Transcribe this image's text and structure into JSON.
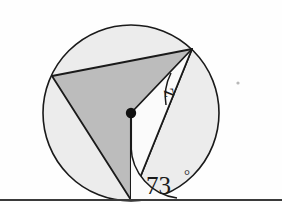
{
  "figure": {
    "background_color": "#fefefe"
  },
  "colors": {
    "stroke": "#1a1a1a",
    "circle_fill": "#ececec",
    "triangle_fill": "#bcbcbc",
    "wedge_fill": "#fbfbfb",
    "arc_fill": "#fbfbfb",
    "center_dot": "#111111",
    "baseline": "#3a3a3a",
    "speck": "#b8b8b8"
  },
  "geometry": {
    "circle": {
      "cx": 131,
      "cy": 113,
      "r": 88
    },
    "center_point": {
      "cx": 131,
      "cy": 113,
      "r": 5
    },
    "vertices": {
      "left": {
        "x": 52,
        "y": 76
      },
      "top_right": {
        "x": 192,
        "y": 49
      },
      "bottom": {
        "x": 131,
        "y": 200
      }
    },
    "baseline": {
      "x1": 0,
      "y1": 200,
      "x2": 282,
      "y2": 200
    },
    "speck": {
      "cx": 238,
      "cy": 83,
      "r": 1.6
    },
    "shaded_triangle_path": "M 52 76 L 192 49 L 131 200 Z",
    "white_wedge_path": "M 131 113 L 192 49 L 131 200 Z",
    "angle_arc_z_path": "M 171 73 A 55 55 0 0 0 165 107",
    "angle_arc_73_path": "M 131 147 A 53 53 0 0 0 177 197"
  },
  "labels": {
    "angle_z": {
      "text": "z",
      "x": 169,
      "y": 93,
      "font_size": 20,
      "rotation": -100
    },
    "angle_73": {
      "value": "73",
      "degree_symbol": "°",
      "x": 146,
      "y": 194,
      "font_size": 25,
      "degree_x": 186,
      "degree_y": 183,
      "degree_font_size": 14
    }
  }
}
